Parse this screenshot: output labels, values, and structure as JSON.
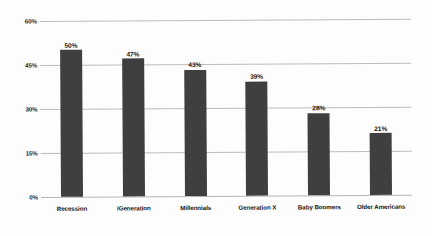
{
  "chart_data": {
    "type": "bar",
    "title": "",
    "subtitle": "",
    "xlabel": "",
    "ylabel": "",
    "categories": [
      "Recession",
      "iGeneration",
      "Millennials",
      "Generation X",
      "Baby Boomers",
      "Older Americans"
    ],
    "values": [
      50,
      47,
      43,
      39,
      28,
      21
    ],
    "value_labels": [
      "50%",
      "47%",
      "43%",
      "39%",
      "28%",
      "21%"
    ],
    "ylim": [
      0,
      60
    ],
    "y_ticks": [
      0,
      15,
      30,
      45,
      60
    ],
    "y_tick_labels": [
      "0%",
      "15%",
      "30%",
      "45%",
      "60%"
    ],
    "grid": true,
    "legend": false,
    "legend_position": "none",
    "series": [
      {
        "name": "",
        "values": [
          50,
          47,
          43,
          39,
          28,
          21
        ]
      }
    ],
    "colors": {
      "bar": "#3f3f3f",
      "gridline": "#bcbcbc",
      "text": "#141414",
      "background": "#fdfdfd"
    }
  }
}
